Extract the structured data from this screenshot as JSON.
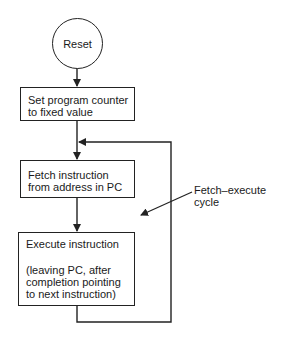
{
  "diagram": {
    "type": "flowchart",
    "colors": {
      "stroke": "#222222",
      "background": "#ffffff",
      "text": "#1a1a1a"
    },
    "nodes": {
      "reset": {
        "shape": "circle",
        "label": "Reset"
      },
      "set_pc": {
        "shape": "rectangle",
        "lines": [
          "Set program counter",
          "to fixed value"
        ]
      },
      "fetch": {
        "shape": "rectangle",
        "lines": [
          "Fetch instruction",
          "from address in PC"
        ]
      },
      "execute": {
        "shape": "rectangle",
        "title": "Execute instruction",
        "note_lines": [
          "(leaving PC, after",
          "completion pointing",
          "to next instruction)"
        ]
      }
    },
    "edges": [
      {
        "from": "reset",
        "to": "set_pc"
      },
      {
        "from": "set_pc",
        "to": "fetch"
      },
      {
        "from": "fetch",
        "to": "execute"
      },
      {
        "from": "execute",
        "to": "fetch",
        "kind": "loop"
      }
    ],
    "annotation": {
      "lines": [
        "Fetch–execute",
        "cycle"
      ],
      "points_to": "loop"
    }
  }
}
